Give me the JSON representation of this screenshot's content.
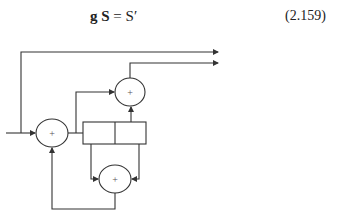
{
  "equation": {
    "lhs_g": "g",
    "lhs_S": "S",
    "equals": " = ",
    "rhs": "S′",
    "number": "(2.159)"
  },
  "diagram": {
    "type": "convolutional encoder block diagram",
    "adders": [
      {
        "id": "adder-input",
        "label": "+"
      },
      {
        "id": "adder-output",
        "label": "+"
      },
      {
        "id": "adder-feedback",
        "label": "+"
      }
    ],
    "register_cells": 2,
    "outputs": 2,
    "stroke_color": "#333333"
  }
}
